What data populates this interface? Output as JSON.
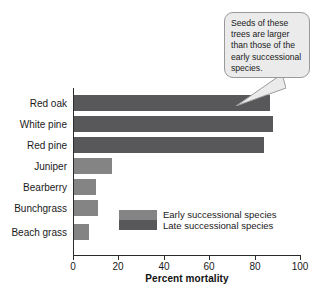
{
  "chart_data": {
    "type": "bar",
    "orientation": "horizontal",
    "title": "",
    "xlabel": "Percent mortality",
    "ylabel": "",
    "xlim": [
      0,
      100
    ],
    "xticks": [
      0,
      20,
      40,
      60,
      80,
      100
    ],
    "grid": false,
    "categories": [
      "Red oak",
      "White pine",
      "Red pine",
      "Juniper",
      "Bearberry",
      "Bunchgrass",
      "Beach grass"
    ],
    "values": [
      87,
      88,
      84,
      17,
      10,
      11,
      7
    ],
    "series": [
      {
        "name": "Early successional species",
        "color": "#848484",
        "members": [
          "Juniper",
          "Bearberry",
          "Bunchgrass",
          "Beach grass"
        ]
      },
      {
        "name": "Late successional species",
        "color": "#58585a",
        "members": [
          "Red oak",
          "White pine",
          "Red pine"
        ]
      }
    ],
    "group_of": [
      "late",
      "late",
      "late",
      "early",
      "early",
      "early",
      "early"
    ],
    "legend": {
      "position": "inside-lower-center",
      "entries": [
        {
          "label": "Early successional species",
          "color": "#848484"
        },
        {
          "label": "Late successional species",
          "color": "#58585a"
        }
      ]
    },
    "annotations": [
      {
        "type": "callout",
        "text": "Seeds of these trees are larger than those of the early successional species.",
        "points_to": "Red oak",
        "background": "#ebebeb",
        "border": "#9a9a9a"
      }
    ]
  },
  "axis": {
    "x_title": "Percent mortality",
    "tick_labels": [
      "0",
      "20",
      "40",
      "60",
      "80",
      "100"
    ]
  },
  "legend": {
    "early_label": "Early successional species",
    "late_label": "Late successional species"
  },
  "callout": {
    "text": "Seeds of these trees are larger than those of the early successional species."
  }
}
